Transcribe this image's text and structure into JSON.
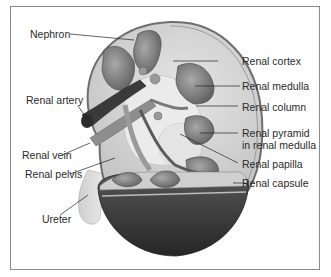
{
  "diagram": {
    "title": "",
    "labels_left": [
      {
        "id": "nephron",
        "text": "Nephron"
      },
      {
        "id": "renal-artery",
        "text": "Renal artery"
      },
      {
        "id": "renal-vein",
        "text": "Renal vein"
      },
      {
        "id": "renal-pelvis",
        "text": "Renal pelvis"
      },
      {
        "id": "ureter",
        "text": "Ureter"
      }
    ],
    "labels_right": [
      {
        "id": "renal-cortex",
        "text": "Renal cortex"
      },
      {
        "id": "renal-medulla",
        "text": "Renal medulla"
      },
      {
        "id": "renal-column",
        "text": "Renal column"
      },
      {
        "id": "renal-pyramid",
        "text": "Renal pyramid",
        "text2": "in renal medulla"
      },
      {
        "id": "renal-papilla",
        "text": "Renal papilla"
      },
      {
        "id": "renal-capsule",
        "text": "Renal capsule"
      }
    ],
    "colors": {
      "frame": "#8a8a8a",
      "capsule": "#7a7a7a",
      "cortex": "#dcdcdc",
      "pyramid": "#8c8c8c",
      "vessel_dark": "#3a3a3a",
      "vessel_mid": "#9a9a9a",
      "ureter": "#d4d4d4",
      "cut_face": "#3c3c3c",
      "leader": "#222222",
      "text": "#2a2a2a"
    }
  }
}
